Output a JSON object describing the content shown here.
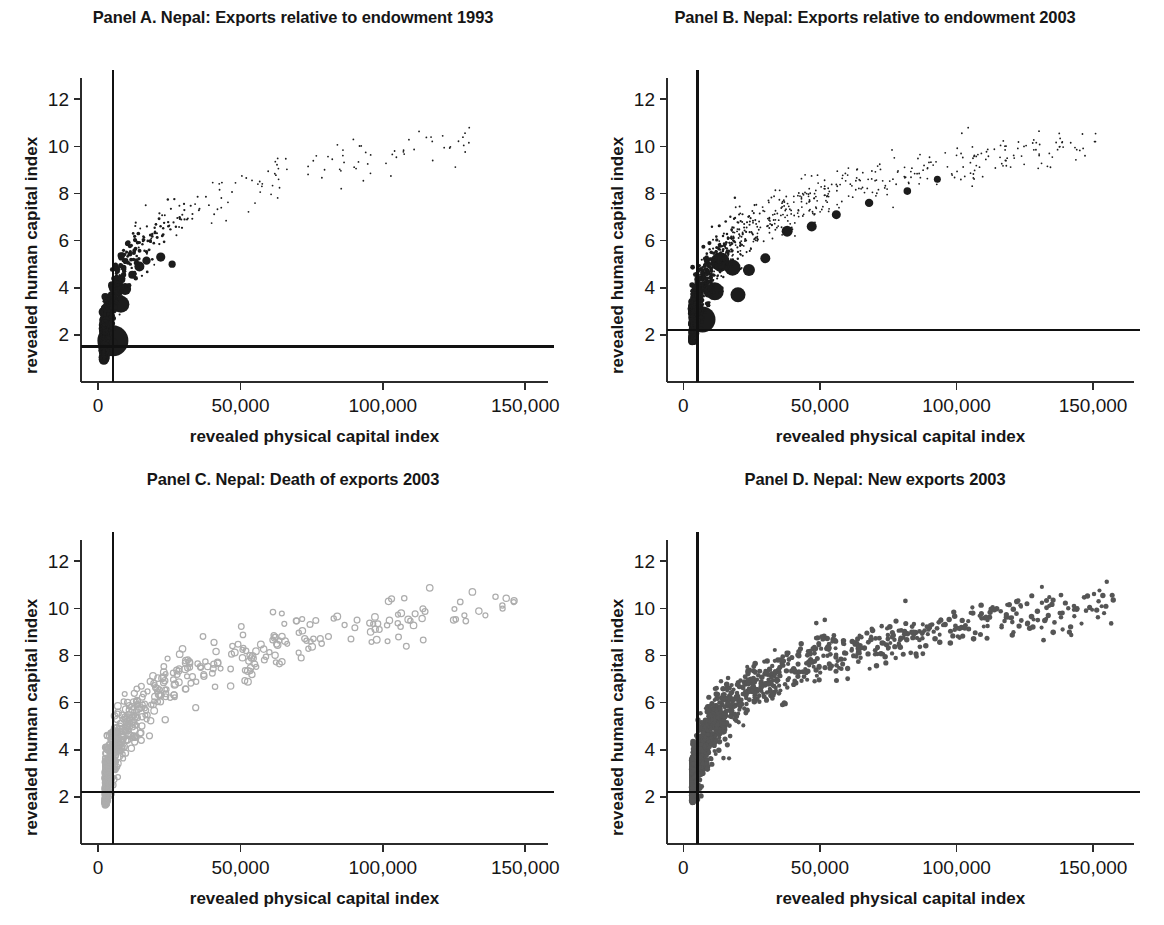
{
  "figure": {
    "width": 1164,
    "height": 925,
    "background": "#ffffff"
  },
  "chart_data": [
    {
      "id": "panel-a",
      "type": "scatter",
      "title": "Panel A. Nepal: Exports relative to endowment 1993",
      "xlabel": "revealed physical capital index",
      "ylabel": "revealed human capital index",
      "xlim": [
        -6000,
        158000
      ],
      "ylim": [
        0,
        12.9
      ],
      "xticks": [
        0,
        50000,
        100000,
        150000
      ],
      "xticklabels": [
        "0",
        "50,000",
        "100,000",
        "150,000"
      ],
      "yticks": [
        2,
        4,
        6,
        8,
        10,
        12
      ],
      "yticklabels": [
        "2",
        "4",
        "6",
        "8",
        "10",
        "12"
      ],
      "grid": false,
      "legend": "none",
      "marker": {
        "style": "filled-circle",
        "color": "#1c1c1c",
        "sized_by_value": true,
        "min_radius": 0.9,
        "max_radius": 15.5
      },
      "reference_lines": {
        "horizontal_y": 1.5,
        "vertical_x": 5200,
        "color": "#111111"
      },
      "n_points": 620,
      "seed": 17,
      "cloud": {
        "x_min": 2000,
        "x_max": 132000,
        "x_skew": 2.3,
        "y_of_x": "log",
        "y_base": 1.6,
        "y_gain": 2.05,
        "y_noise": 0.62,
        "size_decay": 4e-05,
        "big_bubbles": [
          {
            "x": 5200,
            "y": 1.75,
            "r": 15.5
          },
          {
            "x": 8000,
            "y": 3.3,
            "r": 8.5
          },
          {
            "x": 9500,
            "y": 3.95,
            "r": 6.0
          },
          {
            "x": 14500,
            "y": 4.9,
            "r": 5.0
          },
          {
            "x": 17000,
            "y": 5.15,
            "r": 4.2
          },
          {
            "x": 22000,
            "y": 5.3,
            "r": 4.6
          },
          {
            "x": 26000,
            "y": 5.0,
            "r": 3.6
          },
          {
            "x": 12000,
            "y": 4.55,
            "r": 4.0
          }
        ]
      }
    },
    {
      "id": "panel-b",
      "type": "scatter",
      "title": "Panel B. Nepal: Exports relative to endowment 2003",
      "xlabel": "revealed physical capital index",
      "ylabel": "revealed human capital index",
      "xlim": [
        -6000,
        165000
      ],
      "ylim": [
        0,
        12.9
      ],
      "xticks": [
        0,
        50000,
        100000,
        150000
      ],
      "xticklabels": [
        "0",
        "50,000",
        "100,000",
        "150,000"
      ],
      "yticks": [
        2,
        4,
        6,
        8,
        10,
        12
      ],
      "yticklabels": [
        "2",
        "4",
        "6",
        "8",
        "10",
        "12"
      ],
      "grid": false,
      "legend": "none",
      "marker": {
        "style": "filled-circle",
        "color": "#1c1c1c",
        "sized_by_value": true,
        "min_radius": 0.9,
        "max_radius": 13.0
      },
      "reference_lines": {
        "horizontal_y": 2.2,
        "vertical_x": 5200,
        "color": "#111111"
      },
      "n_points": 1150,
      "seed": 42,
      "cloud": {
        "x_min": 3000,
        "x_max": 152000,
        "x_skew": 1.75,
        "y_of_x": "log",
        "y_base": 2.35,
        "y_gain": 1.95,
        "y_noise": 0.68,
        "size_decay": 5.2e-05,
        "big_bubbles": [
          {
            "x": 7000,
            "y": 2.65,
            "r": 13.0
          },
          {
            "x": 11500,
            "y": 3.85,
            "r": 9.0
          },
          {
            "x": 13500,
            "y": 5.1,
            "r": 9.5
          },
          {
            "x": 18000,
            "y": 4.85,
            "r": 8.0
          },
          {
            "x": 20000,
            "y": 3.7,
            "r": 7.5
          },
          {
            "x": 24000,
            "y": 4.75,
            "r": 6.0
          },
          {
            "x": 30000,
            "y": 5.25,
            "r": 5.0
          },
          {
            "x": 38000,
            "y": 6.4,
            "r": 5.5
          },
          {
            "x": 47000,
            "y": 6.6,
            "r": 5.0
          },
          {
            "x": 56000,
            "y": 7.1,
            "r": 4.5
          },
          {
            "x": 68000,
            "y": 7.6,
            "r": 4.2
          },
          {
            "x": 82000,
            "y": 8.1,
            "r": 3.8
          },
          {
            "x": 93000,
            "y": 8.6,
            "r": 3.5
          }
        ]
      }
    },
    {
      "id": "panel-c",
      "type": "scatter",
      "title": "Panel C. Nepal: Death of exports 2003",
      "xlabel": "revealed physical capital index",
      "ylabel": "revealed human capital index",
      "xlim": [
        -6000,
        158000
      ],
      "ylim": [
        0,
        12.9
      ],
      "xticks": [
        0,
        50000,
        100000,
        150000
      ],
      "xticklabels": [
        "0",
        "50,000",
        "100,000",
        "150,000"
      ],
      "yticks": [
        2,
        4,
        6,
        8,
        10,
        12
      ],
      "yticklabels": [
        "2",
        "4",
        "6",
        "8",
        "10",
        "12"
      ],
      "grid": false,
      "legend": "none",
      "marker": {
        "style": "open-circle",
        "color": "#adadad",
        "sized_by_value": false,
        "min_radius": 2.4,
        "max_radius": 3.4
      },
      "reference_lines": {
        "horizontal_y": 2.2,
        "vertical_x": 5200,
        "color": "#111111"
      },
      "n_points": 640,
      "seed": 91,
      "cloud": {
        "x_min": 2500,
        "x_max": 148000,
        "x_skew": 2.0,
        "y_of_x": "log",
        "y_base": 2.35,
        "y_gain": 1.9,
        "y_noise": 0.72,
        "size_decay": 0,
        "big_bubbles": []
      }
    },
    {
      "id": "panel-d",
      "type": "scatter",
      "title": "Panel D. Nepal: New exports 2003",
      "xlabel": "revealed physical capital index",
      "ylabel": "revealed human capital index",
      "xlim": [
        -6000,
        165000
      ],
      "ylim": [
        0,
        12.9
      ],
      "xticks": [
        0,
        50000,
        100000,
        150000
      ],
      "xticklabels": [
        "0",
        "50,000",
        "100,000",
        "150,000"
      ],
      "yticks": [
        2,
        4,
        6,
        8,
        10,
        12
      ],
      "yticklabels": [
        "2",
        "4",
        "6",
        "8",
        "10",
        "12"
      ],
      "grid": false,
      "legend": "none",
      "marker": {
        "style": "filled-circle",
        "color": "#555555",
        "sized_by_value": false,
        "min_radius": 2.0,
        "max_radius": 2.8
      },
      "reference_lines": {
        "horizontal_y": 2.2,
        "vertical_x": 5200,
        "color": "#111111"
      },
      "n_points": 1500,
      "seed": 7,
      "cloud": {
        "x_min": 3000,
        "x_max": 158000,
        "x_skew": 1.7,
        "y_of_x": "log",
        "y_base": 2.45,
        "y_gain": 1.92,
        "y_noise": 0.66,
        "size_decay": 0,
        "big_bubbles": []
      }
    }
  ],
  "layout": {
    "panels": [
      {
        "id": "panel-a",
        "left": 0,
        "top": 0,
        "width": 586,
        "height": 462
      },
      {
        "id": "panel-b",
        "left": 586,
        "top": 0,
        "width": 578,
        "height": 462
      },
      {
        "id": "panel-c",
        "left": 0,
        "top": 462,
        "width": 586,
        "height": 463
      },
      {
        "id": "panel-d",
        "left": 586,
        "top": 462,
        "width": 578,
        "height": 463
      }
    ]
  }
}
